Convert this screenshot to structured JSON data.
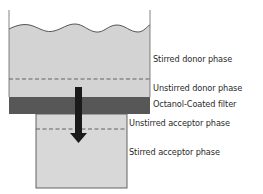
{
  "diagram": {
    "type": "membrane-permeability-setup",
    "colors": {
      "donor_fill": "#d3d3d3",
      "acceptor_fill": "#d8d8d8",
      "filter_fill": "#575757",
      "arrow": "#1a1a1a",
      "outline": "#555555",
      "text": "#2a2a2a"
    },
    "labels": {
      "stirred_donor": "Stirred donor phase",
      "unstirred_donor": "Unstirred donor phase",
      "filter": "Octanol-Coated filter",
      "unstirred_acceptor": "Unstirred acceptor phase",
      "stirred_acceptor": "Stirred acceptor phase"
    },
    "arrow_direction": "down"
  }
}
